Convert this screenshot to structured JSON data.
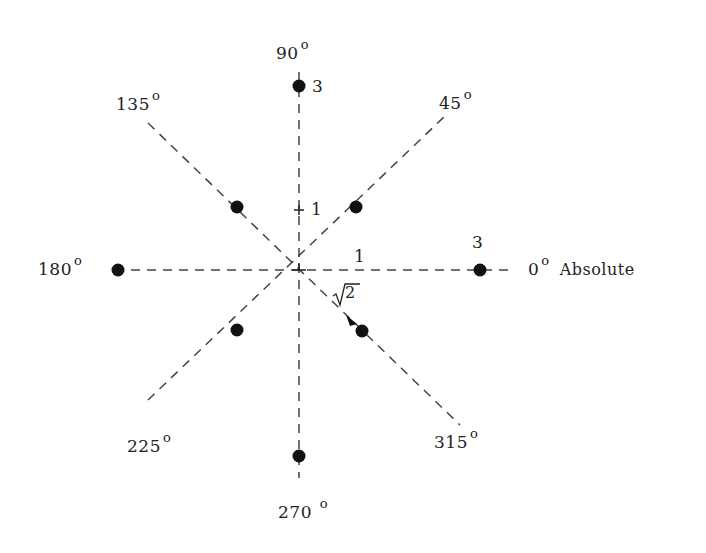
{
  "diagram": {
    "title": "",
    "center": [
      299,
      270
    ],
    "axes": [
      {
        "angle": "0",
        "label": "0",
        "suffix": "Absolute"
      },
      {
        "angle": "45",
        "label": "45"
      },
      {
        "angle": "90",
        "label": "90"
      },
      {
        "angle": "135",
        "label": "135"
      },
      {
        "angle": "180",
        "label": "180"
      },
      {
        "angle": "225",
        "label": "225"
      },
      {
        "angle": "270",
        "label": "270"
      },
      {
        "angle": "315",
        "label": "315"
      }
    ],
    "degree_symbol": "o",
    "annotations": {
      "axis_0_unit": "1",
      "axis_90_unit": "1",
      "axis_0_point": "3",
      "axis_90_point": "3",
      "diagonal": "√2"
    },
    "points": [
      {
        "angle": 0,
        "radius": 3
      },
      {
        "angle": 45,
        "radius": 1.414
      },
      {
        "angle": 90,
        "radius": 3
      },
      {
        "angle": 135,
        "radius": 1.414
      },
      {
        "angle": 180,
        "radius": 3
      },
      {
        "angle": 225,
        "radius": 1.414
      },
      {
        "angle": 270,
        "radius": 3
      },
      {
        "angle": 315,
        "radius": 1.414
      }
    ],
    "colors": {
      "line": "#444444",
      "point": "#111111"
    }
  }
}
